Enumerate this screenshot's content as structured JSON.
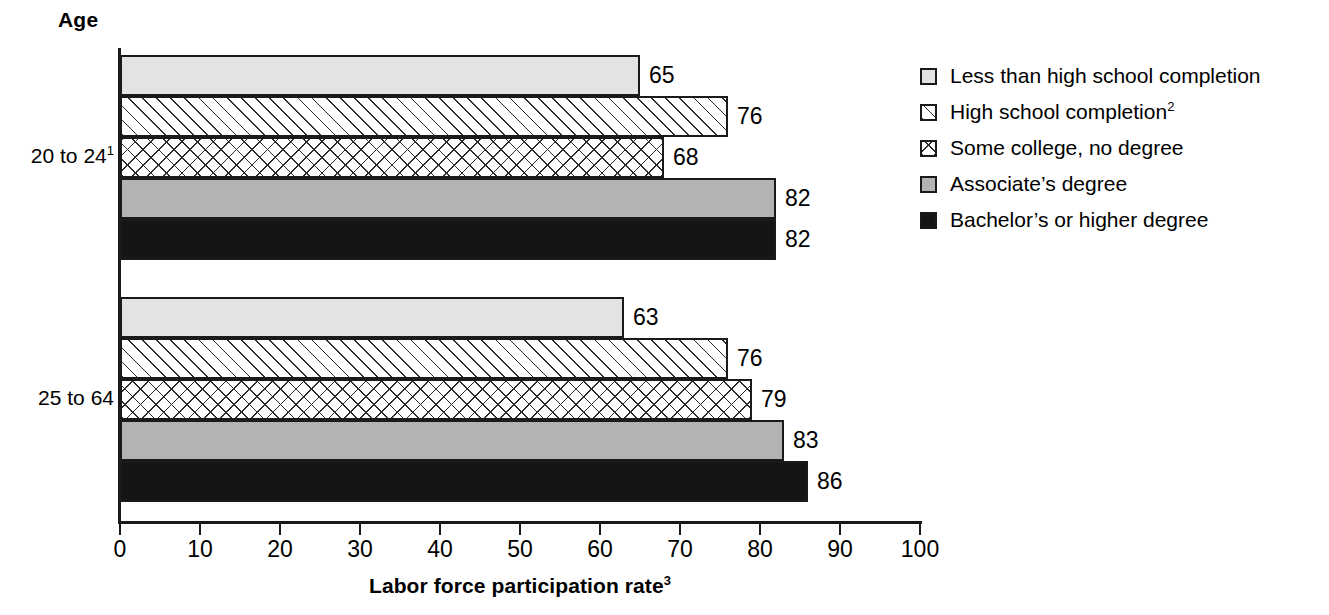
{
  "chart_data": {
    "type": "bar",
    "orientation": "horizontal",
    "title": "",
    "group_axis_title": "Age",
    "xlabel": "Labor force participation rate",
    "xlabel_superscript": "3",
    "ylabel": "",
    "xlim": [
      0,
      100
    ],
    "xticks": [
      0,
      10,
      20,
      30,
      40,
      50,
      60,
      70,
      80,
      90,
      100
    ],
    "xtick_labels": [
      "0",
      "10",
      "20",
      "30",
      "40",
      "50",
      "60",
      "70",
      "80",
      "90",
      "100"
    ],
    "grid": false,
    "legend_position": "right",
    "categories": [
      "20 to 24",
      "25 to 64"
    ],
    "category_labels": [
      "20 to 24¹",
      "25 to 64"
    ],
    "series": [
      {
        "name": "Less than high school completion",
        "pattern": "solid-light-gray",
        "color": "#e3e3e3",
        "values": [
          65,
          63
        ]
      },
      {
        "name": "High school completion²",
        "pattern": "diagonal-hatch",
        "color": "#ffffff",
        "values": [
          76,
          76
        ]
      },
      {
        "name": "Some college, no degree",
        "pattern": "cross-hatch",
        "color": "#ffffff",
        "values": [
          68,
          79
        ]
      },
      {
        "name": "Associate’s degree",
        "pattern": "solid-medium-gray",
        "color": "#b3b3b3",
        "values": [
          82,
          83
        ]
      },
      {
        "name": "Bachelor’s or higher degree",
        "pattern": "solid-black",
        "color": "#151515",
        "values": [
          82,
          86
        ]
      }
    ]
  },
  "legend": {
    "items": [
      {
        "label": "Less than high school completion",
        "label_sup": ""
      },
      {
        "label": "High school completion",
        "label_sup": "2"
      },
      {
        "label": "Some college, no degree",
        "label_sup": ""
      },
      {
        "label": "Associate’s degree",
        "label_sup": ""
      },
      {
        "label": "Bachelor’s or higher degree",
        "label_sup": ""
      }
    ]
  },
  "axis": {
    "title_text": "Labor force participation rate",
    "title_sup": "3",
    "group_title": "Age"
  },
  "groups": [
    {
      "label": "20 to 24",
      "label_sup": "1",
      "bars": [
        {
          "value": 65,
          "value_text": "65",
          "series": "Less than high school completion"
        },
        {
          "value": 76,
          "value_text": "76",
          "series": "High school completion"
        },
        {
          "value": 68,
          "value_text": "68",
          "series": "Some college, no degree"
        },
        {
          "value": 82,
          "value_text": "82",
          "series": "Associate’s degree"
        },
        {
          "value": 82,
          "value_text": "82",
          "series": "Bachelor’s or higher degree"
        }
      ]
    },
    {
      "label": "25 to 64",
      "label_sup": "",
      "bars": [
        {
          "value": 63,
          "value_text": "63",
          "series": "Less than high school completion"
        },
        {
          "value": 76,
          "value_text": "76",
          "series": "High school completion"
        },
        {
          "value": 79,
          "value_text": "79",
          "series": "Some college, no degree"
        },
        {
          "value": 83,
          "value_text": "83",
          "series": "Associate’s degree"
        },
        {
          "value": 86,
          "value_text": "86",
          "series": "Bachelor’s or higher degree"
        }
      ]
    }
  ],
  "ticks": {
    "labels": [
      "0",
      "10",
      "20",
      "30",
      "40",
      "50",
      "60",
      "70",
      "80",
      "90",
      "100"
    ]
  },
  "colors": {
    "axis": "#1a1a1a",
    "text": "#000000",
    "less_than_hs": "#e3e3e3",
    "associate": "#b3b3b3",
    "bachelor": "#151515"
  }
}
